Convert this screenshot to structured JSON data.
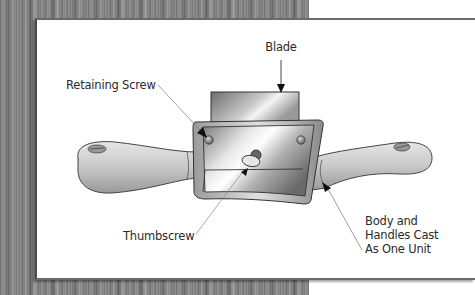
{
  "diagram": {
    "labels": {
      "blade": "Blade",
      "retaining_screw": "Retaining Screw",
      "thumbscrew": "Thumbscrew",
      "body_line1": "Body and",
      "body_line2": "Handles Cast",
      "body_line3": "As One Unit"
    },
    "colors": {
      "background_wood": "#8a8a8a",
      "panel": "#ffffff",
      "panel_border": "#6a6a6a",
      "metal_dark": "#6f6f6f",
      "metal_light": "#f2f2f2",
      "label_text": "#2a2a2a"
    }
  }
}
